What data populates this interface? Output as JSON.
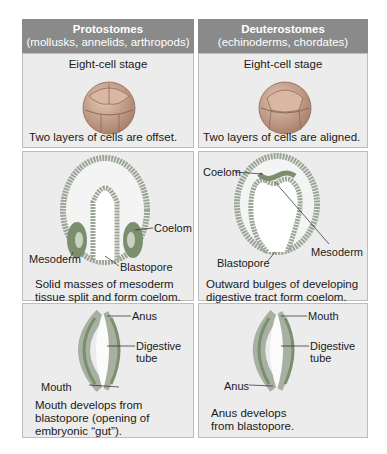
{
  "columns": [
    {
      "title": "Protostomes",
      "subtitle": "(mollusks, annelids, arthropods)",
      "row1": {
        "stage": "Eight-cell stage",
        "caption": "Two layers of cells are offset."
      },
      "row2": {
        "labels": {
          "coelom": "Coelom",
          "mesoderm": "Mesoderm",
          "blastopore": "Blastopore"
        },
        "caption_l1": "Solid masses of mesoderm",
        "caption_l2": "tissue split and form coelom."
      },
      "row3": {
        "labels": {
          "top": "Anus",
          "middle_l1": "Digestive",
          "middle_l2": "tube",
          "bottom": "Mouth"
        },
        "caption_l1": "Mouth develops from",
        "caption_l2": "blastopore (opening of",
        "caption_l3": "embryonic “gut”)."
      }
    },
    {
      "title": "Deuterostomes",
      "subtitle": "(echinoderms, chordates)",
      "row1": {
        "stage": "Eight-cell stage",
        "caption": "Two layers of cells are aligned."
      },
      "row2": {
        "labels": {
          "coelom": "Coelom",
          "mesoderm": "Mesoderm",
          "blastopore": "Blastopore"
        },
        "caption_l1": "Outward bulges of developing",
        "caption_l2": "digestive tract form coelom."
      },
      "row3": {
        "labels": {
          "top": "Mouth",
          "middle_l1": "Digestive",
          "middle_l2": "tube",
          "bottom": "Anus"
        },
        "caption_l1": "Anus develops",
        "caption_l2": "from blastopore."
      }
    }
  ],
  "colors": {
    "header": "#8a8a8a",
    "panel": "#ececec",
    "cell": "#c9a38e",
    "mesoderm": "#7b8f6f",
    "cellwall": "#9aa596"
  }
}
